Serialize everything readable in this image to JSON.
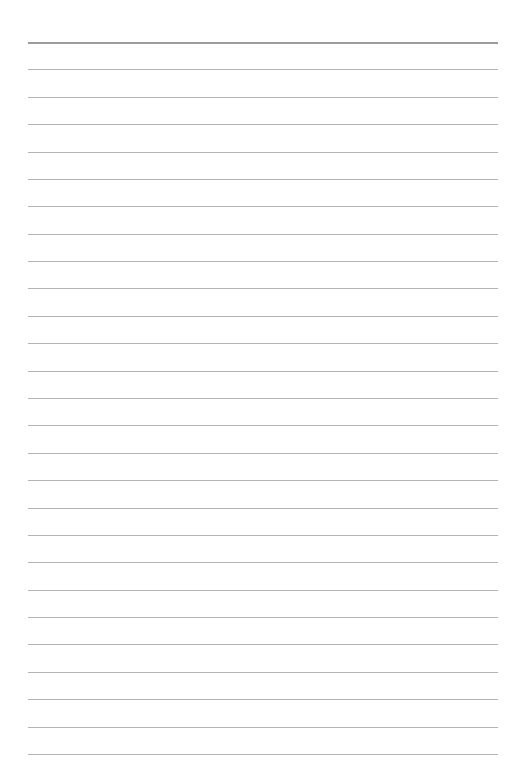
{
  "page": {
    "type": "lined-paper",
    "background": "#ffffff",
    "line_color": "#b4b4b4",
    "first_line_color": "#9c9c9c",
    "line_count": 27,
    "first_line_y": 42,
    "last_line_y": 754,
    "line_left": 28,
    "line_width": 470
  }
}
